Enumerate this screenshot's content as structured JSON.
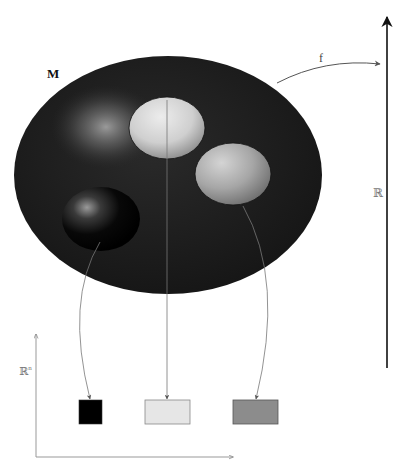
{
  "labels": {
    "manifold": "M",
    "map": "f",
    "real_line": "ℝ",
    "euclidean_space": "ℝ",
    "euclidean_exponent": "n"
  },
  "colors": {
    "manifold_fill": "#1e1e1e",
    "region_light": "#d9d9d9",
    "region_gray": "#a8a8a8",
    "region_black": "#050505",
    "box_black": "#000000",
    "box_light": "#e6e6e6",
    "box_gray": "#8c8c8c",
    "axis_main": "#111111",
    "axis_light": "#999999"
  },
  "regions": [
    {
      "name": "light-region",
      "cx": 167,
      "cy": 128,
      "rx": 38,
      "ry": 31
    },
    {
      "name": "gray-region",
      "cx": 233,
      "cy": 174,
      "rx": 38,
      "ry": 31
    },
    {
      "name": "black-region",
      "cx": 101,
      "cy": 219,
      "rx": 39,
      "ry": 32
    }
  ],
  "boxes": [
    {
      "name": "black-box",
      "x": 79,
      "y": 400,
      "w": 23,
      "h": 24
    },
    {
      "name": "light-box",
      "x": 145,
      "y": 400,
      "w": 45,
      "h": 24
    },
    {
      "name": "gray-box",
      "x": 233,
      "y": 400,
      "w": 45,
      "h": 24
    }
  ]
}
